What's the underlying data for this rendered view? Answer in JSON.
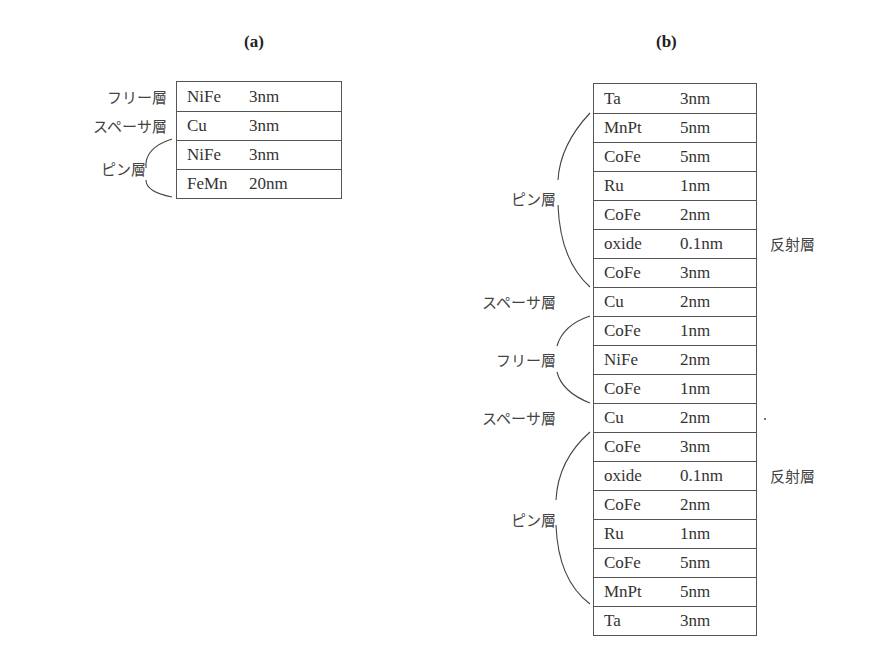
{
  "panel_a": {
    "title": "(a)",
    "layers": [
      {
        "material": "NiFe",
        "thickness": "3nm"
      },
      {
        "material": "Cu",
        "thickness": "3nm"
      },
      {
        "material": "NiFe",
        "thickness": "3nm"
      },
      {
        "material": "FeMn",
        "thickness": "20nm"
      }
    ],
    "labels": {
      "free": "フリー層",
      "spacer": "スペーサ層",
      "pinned": "ピン層"
    }
  },
  "panel_b": {
    "title": "(b)",
    "layers": [
      {
        "material": "Ta",
        "thickness": "3nm"
      },
      {
        "material": "MnPt",
        "thickness": "5nm"
      },
      {
        "material": "CoFe",
        "thickness": "5nm"
      },
      {
        "material": "Ru",
        "thickness": "1nm"
      },
      {
        "material": "CoFe",
        "thickness": "2nm"
      },
      {
        "material": "oxide",
        "thickness": "0.1nm"
      },
      {
        "material": "CoFe",
        "thickness": "3nm"
      },
      {
        "material": "Cu",
        "thickness": "2nm"
      },
      {
        "material": "CoFe",
        "thickness": "1nm"
      },
      {
        "material": "NiFe",
        "thickness": "2nm"
      },
      {
        "material": "CoFe",
        "thickness": "1nm"
      },
      {
        "material": "Cu",
        "thickness": "2nm"
      },
      {
        "material": "CoFe",
        "thickness": "3nm"
      },
      {
        "material": "oxide",
        "thickness": "0.1nm"
      },
      {
        "material": "CoFe",
        "thickness": "2nm"
      },
      {
        "material": "Ru",
        "thickness": "1nm"
      },
      {
        "material": "CoFe",
        "thickness": "5nm"
      },
      {
        "material": "MnPt",
        "thickness": "5nm"
      },
      {
        "material": "Ta",
        "thickness": "3nm"
      }
    ],
    "labels": {
      "pinned_top": "ピン層",
      "spacer_top": "スペーサ層",
      "free": "フリー層",
      "spacer_bottom": "スペーサ層",
      "pinned_bottom": "ピン層",
      "reflect_top": "反射層",
      "reflect_bottom": "反射層"
    }
  }
}
